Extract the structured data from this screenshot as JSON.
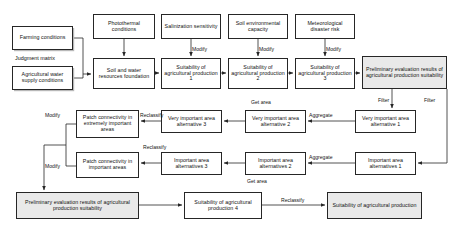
{
  "diagram": {
    "colors": {
      "line": "#262626",
      "shaded_fill": "#e9e9e9",
      "box_fill": "#ffffff"
    },
    "nodes": [
      {
        "id": "farming_conditions",
        "label": "Farming conditions",
        "style": "shadow",
        "x": 12,
        "y": 26,
        "w": 61,
        "h": 24
      },
      {
        "id": "agri_water_supply",
        "label": "Agricultural water supply conditions",
        "style": "shadow",
        "x": 12,
        "y": 66,
        "w": 61,
        "h": 24
      },
      {
        "id": "photothermal",
        "label": "Photothermal conditions",
        "style": "plain",
        "x": 93,
        "y": 14,
        "w": 62,
        "h": 25
      },
      {
        "id": "salinization",
        "label": "Salinization sensitivity",
        "style": "plain",
        "x": 161,
        "y": 14,
        "w": 60,
        "h": 25
      },
      {
        "id": "soil_env_capacity",
        "label": "Soil environmental capacity",
        "style": "plain",
        "x": 228,
        "y": 14,
        "w": 60,
        "h": 25
      },
      {
        "id": "meteorological_risk",
        "label": "Meteorological disaster risk",
        "style": "plain",
        "x": 295,
        "y": 14,
        "w": 60,
        "h": 25
      },
      {
        "id": "soil_water_found",
        "label": "Soil and water resources foundation",
        "style": "plain",
        "x": 93,
        "y": 58,
        "w": 62,
        "h": 31
      },
      {
        "id": "suitability_1",
        "label": "Suitability of agricultural production 1",
        "style": "plain",
        "x": 161,
        "y": 58,
        "w": 60,
        "h": 31
      },
      {
        "id": "suitability_2",
        "label": "Suitability of agricultural production 2",
        "style": "plain",
        "x": 228,
        "y": 58,
        "w": 60,
        "h": 31
      },
      {
        "id": "suitability_3",
        "label": "Suitability of agricultural production 3",
        "style": "plain",
        "x": 295,
        "y": 58,
        "w": 60,
        "h": 31
      },
      {
        "id": "prelim_eval_top",
        "label": "Preliminary evaluation results of agricultural production suitability",
        "style": "shaded",
        "x": 362,
        "y": 56,
        "w": 85,
        "h": 33
      },
      {
        "id": "patch_conn_extremely",
        "label": "Patch connectivity in extremely important areas",
        "style": "plain",
        "x": 76,
        "y": 110,
        "w": 63,
        "h": 28
      },
      {
        "id": "patch_conn_important",
        "label": "Patch connectivity in important areas",
        "style": "plain",
        "x": 76,
        "y": 152,
        "w": 63,
        "h": 26
      },
      {
        "id": "very_important_alt3",
        "label": "Very important area alternative 3",
        "style": "plain",
        "x": 161,
        "y": 110,
        "w": 61,
        "h": 23
      },
      {
        "id": "very_important_alt2",
        "label": "Very important area alternative 2",
        "style": "plain",
        "x": 245,
        "y": 110,
        "w": 61,
        "h": 23
      },
      {
        "id": "very_important_alt1",
        "label": "Very important area alternative 1",
        "style": "plain",
        "x": 355,
        "y": 110,
        "w": 61,
        "h": 23
      },
      {
        "id": "important_alt3",
        "label": "Important area alternatives 3",
        "style": "plain",
        "x": 161,
        "y": 152,
        "w": 61,
        "h": 23
      },
      {
        "id": "important_alt2",
        "label": "Important area alternatives 2",
        "style": "plain",
        "x": 245,
        "y": 152,
        "w": 61,
        "h": 23
      },
      {
        "id": "important_alt1",
        "label": "Important area alternatives 1",
        "style": "plain",
        "x": 355,
        "y": 152,
        "w": 61,
        "h": 23
      },
      {
        "id": "prelim_eval_bottom",
        "label": "Preliminary evaluation results of agricultural production suitability",
        "style": "shaded",
        "x": 16,
        "y": 192,
        "w": 123,
        "h": 27
      },
      {
        "id": "suitability_4",
        "label": "Suitability of agricultural production 4",
        "style": "plain",
        "x": 184,
        "y": 192,
        "w": 78,
        "h": 27
      },
      {
        "id": "final_suitability",
        "label": "Suitability of agricultural production",
        "style": "shaded",
        "x": 327,
        "y": 192,
        "w": 95,
        "h": 27
      }
    ],
    "edge_labels": [
      {
        "id": "judgment-matrix",
        "text": "Judgment matrix",
        "x": 15,
        "y": 55
      },
      {
        "id": "modify-salinization",
        "text": "Modify",
        "x": 192,
        "y": 46
      },
      {
        "id": "modify-soil-env",
        "text": "Modify",
        "x": 259,
        "y": 46
      },
      {
        "id": "modify-meteorological",
        "text": "Modify",
        "x": 326,
        "y": 46
      },
      {
        "id": "filter-left",
        "text": "Filter",
        "x": 378,
        "y": 97
      },
      {
        "id": "filter-right",
        "text": "Filter",
        "x": 424,
        "y": 97
      },
      {
        "id": "aggregate-very-important",
        "text": "Aggregate",
        "x": 311,
        "y": 113
      },
      {
        "id": "aggregate-important",
        "text": "Aggregate",
        "x": 311,
        "y": 155
      },
      {
        "id": "get-area-very-important",
        "text": "Get area",
        "x": 252,
        "y": 100
      },
      {
        "id": "get-area-important",
        "text": "Get area",
        "x": 247,
        "y": 180
      },
      {
        "id": "reclassify-extremely",
        "text": "Reclassify",
        "x": 140,
        "y": 113
      },
      {
        "id": "reclassify-important",
        "text": "Reclassify",
        "x": 143,
        "y": 145
      },
      {
        "id": "modify-extremely",
        "text": "Modify",
        "x": 47,
        "y": 113
      },
      {
        "id": "modify-important",
        "text": "Modify",
        "x": 47,
        "y": 164
      },
      {
        "id": "reclassify-final",
        "text": "Reclassify",
        "x": 281,
        "y": 198
      }
    ]
  }
}
